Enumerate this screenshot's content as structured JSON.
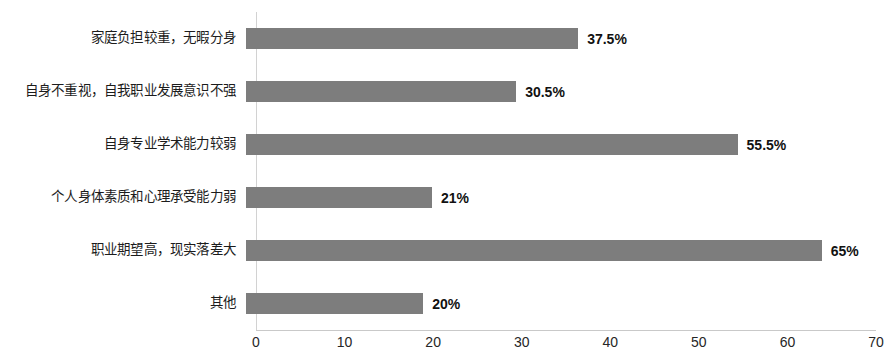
{
  "chart_data": {
    "type": "bar",
    "orientation": "horizontal",
    "title": "",
    "subtitle": "",
    "xlabel": "",
    "ylabel": "",
    "categories": [
      "家庭负担较重，无暇分身",
      "自身不重视，自我职业发展意识不强",
      "自身专业学术能力较弱",
      "个人身体素质和心理承受能力弱",
      "职业期望高，现实落差大",
      "其他"
    ],
    "values": [
      37.5,
      30.5,
      55.5,
      21,
      65,
      20
    ],
    "value_labels": [
      "37.5%",
      "30.5%",
      "55.5%",
      "21%",
      "65%",
      "20%"
    ],
    "xlim": [
      0,
      70
    ],
    "xticks": [
      0,
      10,
      20,
      30,
      40,
      50,
      60,
      70
    ],
    "xtick_labels": [
      "0",
      "10",
      "20",
      "30",
      "40",
      "50",
      "60",
      "70"
    ],
    "grid": false,
    "legend": false,
    "bar_color": "#7d7d7d",
    "background_color": "#ffffff",
    "axis_color": "#c9c9c9"
  }
}
